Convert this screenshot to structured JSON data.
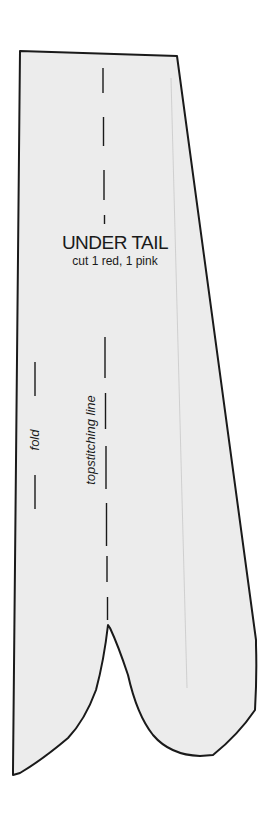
{
  "pattern_piece": {
    "title": "UNDER TAIL",
    "instructions": "cut 1 red, 1 pink",
    "fold_label": "fold",
    "topstitching_label": "topstitching line"
  },
  "colors": {
    "paper": "#ffffff",
    "piece_fill": "#ececec",
    "outline": "#1a1a1a",
    "faint_line": "#c8c8c8"
  }
}
